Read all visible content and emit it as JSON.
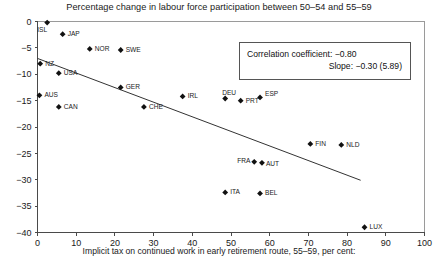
{
  "chart_data": {
    "type": "scatter",
    "title": "Percentage change in labour force participation between 50–54 and 55–59",
    "xlabel": "Implicit tax on continued work in early retirement route, 55–59, per cent:",
    "ylabel": "",
    "xlim": [
      0,
      100
    ],
    "ylim": [
      -40,
      0
    ],
    "xticks": [
      "0",
      "10",
      "20",
      "30",
      "40",
      "50",
      "60",
      "70",
      "80",
      "90",
      "100"
    ],
    "yticks": [
      "0",
      "−5",
      "−10",
      "−15",
      "−20",
      "−25",
      "−30",
      "−35",
      "−40"
    ],
    "grid": false,
    "legend": null,
    "points": [
      {
        "label": "ISL",
        "x": 2.5,
        "y": -0.2,
        "lx": -10,
        "ly": 9
      },
      {
        "label": "JAP",
        "x": 6.5,
        "y": -2.4,
        "lx": 5,
        "ly": 2
      },
      {
        "label": "NOR",
        "x": 13.5,
        "y": -5.2,
        "lx": 5,
        "ly": 2
      },
      {
        "label": "SWE",
        "x": 21.5,
        "y": -5.4,
        "lx": 5,
        "ly": 2
      },
      {
        "label": "NZ",
        "x": 0.7,
        "y": -8.0,
        "lx": 5,
        "ly": 2
      },
      {
        "label": "USA",
        "x": 5.5,
        "y": -9.8,
        "lx": 5,
        "ly": 2
      },
      {
        "label": "AUS",
        "x": 0.5,
        "y": -14.0,
        "lx": 5,
        "ly": 2
      },
      {
        "label": "CAN",
        "x": 5.5,
        "y": -16.2,
        "lx": 5,
        "ly": 2
      },
      {
        "label": "GER",
        "x": 21.5,
        "y": -12.5,
        "lx": 5,
        "ly": 2
      },
      {
        "label": "CHE",
        "x": 27.5,
        "y": -16.2,
        "lx": 5,
        "ly": 2
      },
      {
        "label": "IRL",
        "x": 37.5,
        "y": -14.2,
        "lx": 5,
        "ly": 2
      },
      {
        "label": "DEU",
        "x": 48.5,
        "y": -14.6,
        "lx": -3,
        "ly": -4
      },
      {
        "label": "PRT",
        "x": 52.5,
        "y": -15.0,
        "lx": 5,
        "ly": 2
      },
      {
        "label": "ESP",
        "x": 57.5,
        "y": -14.4,
        "lx": 5,
        "ly": -1
      },
      {
        "label": "FRA",
        "x": 56.0,
        "y": -26.6,
        "lx": -17,
        "ly": 1
      },
      {
        "label": "AUT",
        "x": 58.0,
        "y": -26.8,
        "lx": 4,
        "ly": 3
      },
      {
        "label": "FIN",
        "x": 70.5,
        "y": -23.2,
        "lx": 5,
        "ly": 2
      },
      {
        "label": "NLD",
        "x": 78.5,
        "y": -23.4,
        "lx": 5,
        "ly": 2
      },
      {
        "label": "ITA",
        "x": 48.5,
        "y": -32.4,
        "lx": 5,
        "ly": 2
      },
      {
        "label": "BEL",
        "x": 57.5,
        "y": -32.6,
        "lx": 5,
        "ly": 2
      },
      {
        "label": "LUX",
        "x": 84.5,
        "y": -39.0,
        "lx": 5,
        "ly": 2
      }
    ],
    "trendline": {
      "x0": 0,
      "y0": -7.0,
      "x1": 83.5,
      "y1": -30.1
    },
    "annotations": {
      "correlation_label": "Correlation coefficient: −0.80",
      "slope_label": "Slope: −0.30 (5.89)"
    }
  }
}
